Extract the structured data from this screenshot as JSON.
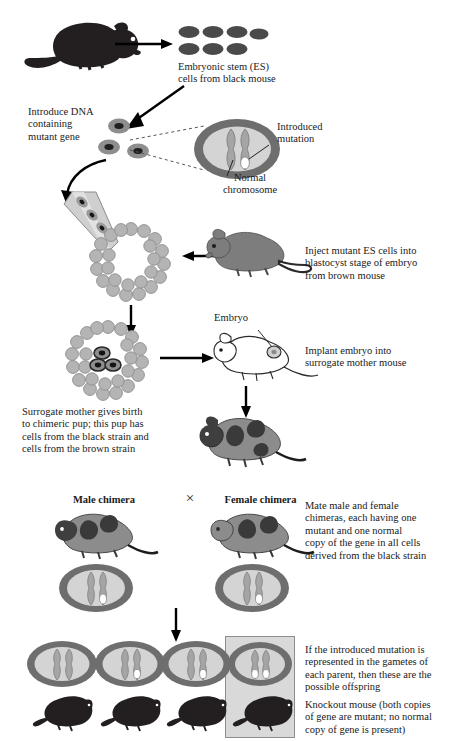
{
  "figure": {
    "palette": {
      "black_mouse": "#231f20",
      "brown_mouse": "#7d7d7d",
      "white_mouse_outline": "#2b2b2b",
      "chimera_body": "#8c8c8c",
      "chimera_patch": "#3a3a3a",
      "cell_membrane": "#6e6e6e",
      "cell_cytoplasm": "#d4d4d4",
      "chromosome": "#9a9a9a",
      "mutation": "#ffffff",
      "blastocyst_cell": "#b4b4b4",
      "highlight_box": "#d9d9d9",
      "arrow": "#000000",
      "text": "#1a1a1a"
    }
  },
  "steps": {
    "es_cells": {
      "label": "Embryonic stem (ES)\ncells from black mouse",
      "top_row_count": 4,
      "bottom_row_count": 3
    },
    "introduce_dna": {
      "label": "Introduce DNA\ncontaining\nmutant gene",
      "cell_count": 3
    },
    "cell_callout": {
      "introduced_mutation_label": "Introduced\nmutation",
      "normal_chromosome_label": "Normal\nchromosome",
      "chromosome_count": 2,
      "mutations": 1
    },
    "inject": {
      "label": "Inject mutant ES cells into\nblastocyst stage of embryo\nfrom brown mouse",
      "pipette_cells": 3
    },
    "implant": {
      "label": "Implant embryo into\nsurrogate mother mouse",
      "embryo_label": "Embryo",
      "injected_cells": 3
    },
    "birth": {
      "label": "Surrogate mother gives birth\nto chimeric pup; this pup has\ncells from the black strain and\ncells from the brown strain"
    }
  },
  "cross": {
    "male_label": "Male chimera",
    "female_label": "Female chimera",
    "cross_symbol": "×",
    "mate_note": "Mate male and female\nchimeras, each having one\nmutant and one normal\ncopy of the gene in all cells\nderived from the black strain",
    "parent_cells": [
      {
        "name": "male-chimera-cell",
        "chromosomes": 2,
        "mutations": 1
      },
      {
        "name": "female-chimera-cell",
        "chromosomes": 2,
        "mutations": 1
      }
    ]
  },
  "offspring": {
    "note": "If the introduced mutation is\nrepresented in the gametes of\neach parent, then these are the\npossible offspring",
    "knockout_note": "Knockout mouse (both copies\nof gene are mutant; no normal\ncopy of gene is present)",
    "items": [
      {
        "name": "offspring-1",
        "mutations": 0,
        "highlight": false,
        "mouse_color": "black"
      },
      {
        "name": "offspring-2",
        "mutations": 1,
        "highlight": false,
        "mouse_color": "black"
      },
      {
        "name": "offspring-3",
        "mutations": 1,
        "highlight": false,
        "mouse_color": "black"
      },
      {
        "name": "offspring-4",
        "mutations": 2,
        "highlight": true,
        "mouse_color": "black"
      }
    ]
  }
}
